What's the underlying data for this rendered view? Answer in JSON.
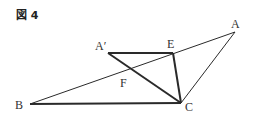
{
  "figure": {
    "title": "図 4"
  },
  "points": {
    "A": {
      "label": "A",
      "x": 235,
      "y": 32
    },
    "A_prime": {
      "label": "A′",
      "x": 108,
      "y": 53
    },
    "E": {
      "label": "E",
      "x": 173,
      "y": 53
    },
    "B": {
      "label": "B",
      "x": 30,
      "y": 104
    },
    "C": {
      "label": "C",
      "x": 181,
      "y": 103
    },
    "F": {
      "label": "F",
      "x": 127,
      "y": 74
    }
  },
  "segments": [
    {
      "from": "B",
      "to": "C",
      "weight": "thick"
    },
    {
      "from": "B",
      "to": "A",
      "weight": "thin"
    },
    {
      "from": "A",
      "to": "C",
      "weight": "thin"
    },
    {
      "from": "A_prime",
      "to": "E",
      "weight": "thick"
    },
    {
      "from": "A_prime",
      "to": "C",
      "weight": "thick"
    },
    {
      "from": "E",
      "to": "C",
      "weight": "thick"
    }
  ],
  "colors": {
    "line": "#2a2a2a",
    "label": "#333333"
  }
}
